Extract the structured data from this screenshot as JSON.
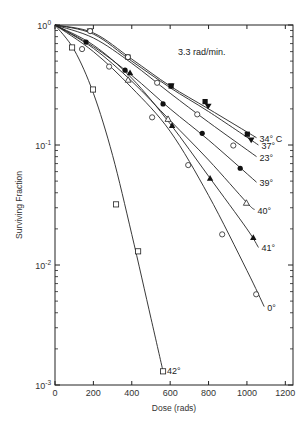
{
  "chart_data": {
    "type": "line",
    "title": "",
    "annotation": "3.3 rad/min.",
    "xlabel": "Dose (rads)",
    "ylabel": "Surviving Fraction",
    "xscale": "linear",
    "yscale": "log",
    "xlim": [
      0,
      1200
    ],
    "ylim": [
      0.001,
      1
    ],
    "xticks": [
      "0",
      "200",
      "400",
      "600",
      "800",
      "1000",
      "1200"
    ],
    "xtick_values": [
      0,
      200,
      400,
      600,
      800,
      1000,
      1200
    ],
    "yticks": [
      {
        "base": "10",
        "exp": "0",
        "value": 1
      },
      {
        "base": "10",
        "exp": "-1",
        "value": 0.1
      },
      {
        "base": "10",
        "exp": "-2",
        "value": 0.01
      },
      {
        "base": "10",
        "exp": "-3",
        "value": 0.001
      }
    ],
    "grid": false,
    "legend": "inline labels at line ends",
    "series": [
      {
        "name": "34° C",
        "marker": "filled-square",
        "points": [
          [
            0,
            1.0
          ],
          [
            380,
            0.54
          ],
          [
            605,
            0.31
          ],
          [
            782,
            0.23
          ],
          [
            1002,
            0.123
          ]
        ],
        "curve": [
          [
            0,
            1.0
          ],
          [
            200,
            0.86
          ],
          [
            400,
            0.52
          ],
          [
            600,
            0.31
          ],
          [
            800,
            0.2
          ],
          [
            1050,
            0.115
          ]
        ]
      },
      {
        "name": "37°",
        "marker": "filled-inverted-triangle",
        "points": [
          [
            0,
            1.0
          ],
          [
            183,
            0.89
          ],
          [
            605,
            0.31
          ],
          [
            798,
            0.21
          ],
          [
            1022,
            0.11
          ]
        ],
        "curve": [
          [
            0,
            1.0
          ],
          [
            200,
            0.84
          ],
          [
            400,
            0.5
          ],
          [
            600,
            0.3
          ],
          [
            800,
            0.19
          ],
          [
            1060,
            0.1
          ]
        ]
      },
      {
        "name": "23°",
        "marker": "open-circle",
        "points": [
          [
            0,
            1.0
          ],
          [
            183,
            0.89
          ],
          [
            380,
            0.54
          ],
          [
            532,
            0.33
          ],
          [
            741,
            0.18
          ],
          [
            929,
            0.099
          ]
        ],
        "curve": [
          [
            0,
            1.0
          ],
          [
            200,
            0.78
          ],
          [
            400,
            0.48
          ],
          [
            600,
            0.27
          ],
          [
            800,
            0.155
          ],
          [
            1050,
            0.08
          ]
        ]
      },
      {
        "name": "39°",
        "marker": "filled-circle",
        "points": [
          [
            0,
            1.0
          ],
          [
            162,
            0.72
          ],
          [
            365,
            0.42
          ],
          [
            563,
            0.22
          ],
          [
            767,
            0.125
          ],
          [
            965,
            0.064
          ]
        ],
        "curve": [
          [
            0,
            1.0
          ],
          [
            200,
            0.66
          ],
          [
            400,
            0.38
          ],
          [
            600,
            0.2
          ],
          [
            800,
            0.11
          ],
          [
            1050,
            0.049
          ]
        ]
      },
      {
        "name": "40°",
        "marker": "open-triangle",
        "points": [
          [
            0,
            1.0
          ],
          [
            381,
            0.35
          ],
          [
            589,
            0.165
          ],
          [
            997,
            0.033
          ]
        ],
        "curve": [
          [
            0,
            1.0
          ],
          [
            200,
            0.64
          ],
          [
            400,
            0.34
          ],
          [
            600,
            0.16
          ],
          [
            800,
            0.075
          ],
          [
            1000,
            0.033
          ],
          [
            1040,
            0.029
          ]
        ]
      },
      {
        "name": "41°",
        "marker": "filled-triangle",
        "points": [
          [
            0,
            1.0
          ],
          [
            391,
            0.4
          ],
          [
            610,
            0.146
          ],
          [
            808,
            0.053
          ],
          [
            1033,
            0.017
          ]
        ],
        "curve": [
          [
            0,
            1.0
          ],
          [
            200,
            0.68
          ],
          [
            400,
            0.36
          ],
          [
            600,
            0.15
          ],
          [
            800,
            0.055
          ],
          [
            1000,
            0.02
          ],
          [
            1060,
            0.014
          ]
        ]
      },
      {
        "name": "0°",
        "marker": "open-circle",
        "points": [
          [
            0,
            1.0
          ],
          [
            141,
            0.63
          ],
          [
            282,
            0.45
          ],
          [
            506,
            0.17
          ],
          [
            694,
            0.068
          ],
          [
            871,
            0.018
          ],
          [
            1048,
            0.0057
          ]
        ],
        "curve": [
          [
            0,
            1.0
          ],
          [
            200,
            0.6
          ],
          [
            400,
            0.3
          ],
          [
            600,
            0.13
          ],
          [
            800,
            0.038
          ],
          [
            1000,
            0.009
          ],
          [
            1090,
            0.0045
          ]
        ]
      },
      {
        "name": "42°",
        "marker": "open-square",
        "points": [
          [
            0,
            1.0
          ],
          [
            89,
            0.65
          ],
          [
            198,
            0.29
          ],
          [
            318,
            0.032
          ],
          [
            433,
            0.013
          ],
          [
            563,
            0.0013
          ]
        ],
        "curve": [
          [
            0,
            1.0
          ],
          [
            100,
            0.62
          ],
          [
            200,
            0.27
          ],
          [
            300,
            0.082
          ],
          [
            400,
            0.018
          ],
          [
            500,
            0.0036
          ],
          [
            563,
            0.0013
          ]
        ]
      }
    ]
  }
}
